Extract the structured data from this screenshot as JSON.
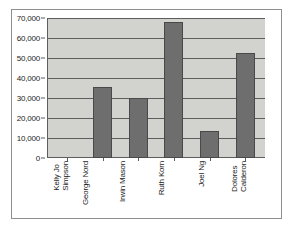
{
  "chart_data": {
    "type": "bar",
    "title": "",
    "subtitle": "",
    "xlabel": "",
    "ylabel": "",
    "categories": [
      "Kelly Jo Simpson",
      "George Nord",
      "Irwin Mason",
      "Ruth Korn",
      "Joel Ng",
      "Dolores Calderon"
    ],
    "category_lines": [
      [
        "Kelly Jo",
        "Simpson"
      ],
      [
        "George Nord",
        ""
      ],
      [
        "Irwin Mason",
        ""
      ],
      [
        "Ruth Korn",
        ""
      ],
      [
        "Joel Ng",
        ""
      ],
      [
        "Dolores",
        "Calderon"
      ]
    ],
    "values": [
      0,
      35500,
      30000,
      68000,
      13500,
      52500
    ],
    "ylim": [
      0,
      70000
    ],
    "ytick_values": [
      0,
      10000,
      20000,
      30000,
      40000,
      50000,
      60000,
      70000
    ],
    "ytick_labels": [
      "0",
      "10,000",
      "20,000",
      "30,000",
      "40,000",
      "50,000",
      "60,000",
      "70,000"
    ],
    "grid": true,
    "legend": false,
    "legend_position": "none",
    "colors": {
      "bar_fill": "#6f6e6f",
      "bar_border": "#4a494a",
      "plot_background": "#d2d2cf",
      "gridline": "#5d5d5d",
      "axis": "#5d5d5d",
      "frame": "#8e8e8e",
      "page_background": "#ffffff",
      "text": "#1c1c1c"
    }
  }
}
